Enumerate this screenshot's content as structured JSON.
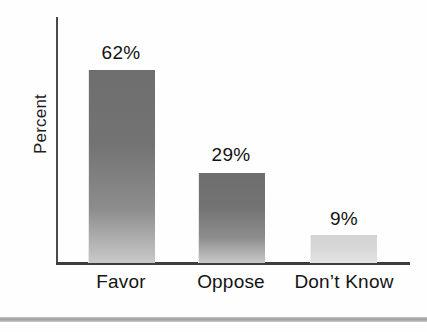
{
  "chart_data": {
    "type": "bar",
    "title": "",
    "subtitle": "",
    "xlabel": "",
    "ylabel": "Percent",
    "categories": [
      "Favor",
      "Oppose",
      "Don’t Know"
    ],
    "values": [
      62,
      29,
      9
    ],
    "value_labels": [
      "62%",
      "29%",
      "9%"
    ],
    "unit": "%",
    "ylim": [
      0,
      80
    ],
    "grid": false,
    "legend": null,
    "legend_position": "none",
    "orientation": "vertical",
    "bar_styles": [
      {
        "category": "Favor",
        "shade": "dark",
        "top_color": "#6e6e6e",
        "bottom_color": "#c9c9c9"
      },
      {
        "category": "Oppose",
        "shade": "dark",
        "top_color": "#6e6e6e",
        "bottom_color": "#c9c9c9"
      },
      {
        "category": "Don’t Know",
        "shade": "light",
        "top_color": "#d3d3d3",
        "bottom_color": "#e3e3e3"
      }
    ],
    "axis_color": "#3d3d3d",
    "text_color": "#141414",
    "background": "#fefefe"
  },
  "figure": {
    "bottom_rule_color": "#9e9e9e"
  }
}
